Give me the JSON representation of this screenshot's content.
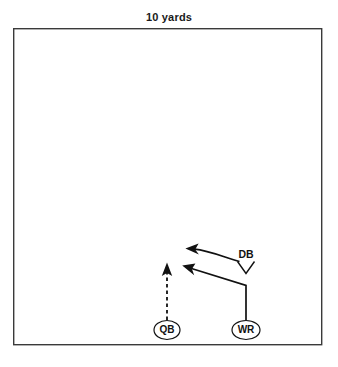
{
  "title": "10 yards",
  "field": {
    "name": "play-field",
    "x": 13,
    "y": 28,
    "width": 309,
    "height": 317,
    "border_color": "#3a3a3a",
    "fill_color": "#ffffff",
    "border_width": 1.4
  },
  "players": [
    {
      "id": "qb",
      "label": "QB",
      "marker": "ellipse",
      "cx": 167,
      "cy": 330,
      "rx": 13,
      "ry": 9.5,
      "stroke": "#111111"
    },
    {
      "id": "wr",
      "label": "WR",
      "marker": "ellipse",
      "cx": 246,
      "cy": 330,
      "rx": 14,
      "ry": 9.5,
      "stroke": "#111111"
    },
    {
      "id": "db",
      "label": "DB",
      "marker": "chevron",
      "cx": 246,
      "cy": 267,
      "label_x": 246,
      "label_y": 255,
      "stroke": "#111111"
    }
  ],
  "routes": [
    {
      "id": "qb-drop",
      "player": "QB",
      "style": "dashed",
      "dash_pattern": "3.5,3",
      "stroke": "#111111",
      "stroke_width": 1.8,
      "path": "M 167 320 L 167 272",
      "arrowhead": {
        "x": 167,
        "y": 264,
        "direction": "up"
      }
    },
    {
      "id": "wr-route",
      "player": "WR",
      "style": "solid",
      "stroke": "#111111",
      "stroke_width": 1.7,
      "path": "M 246 320 L 246 285 L 190 268",
      "arrowhead": {
        "x": 183,
        "y": 266,
        "direction": "up-left"
      }
    },
    {
      "id": "db-coverage",
      "player": "DB",
      "style": "curved",
      "stroke": "#111111",
      "stroke_width": 1.7,
      "path": "M 239 262 C 224 257 208 250 193 249",
      "arrowhead": {
        "x": 186,
        "y": 249,
        "direction": "left"
      }
    }
  ],
  "colors": {
    "ink": "#111111",
    "field_border": "#3a3a3a",
    "background": "#ffffff"
  }
}
